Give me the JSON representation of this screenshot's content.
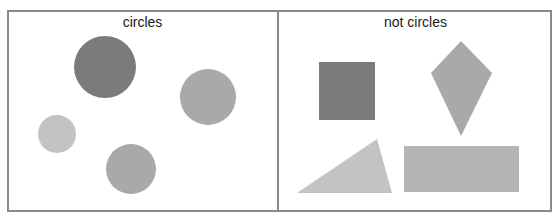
{
  "panels": [
    {
      "title": "circles",
      "shapes": [
        {
          "type": "circle",
          "cx": 105,
          "cy": 67,
          "r": 31,
          "color": "#7b7b7b"
        },
        {
          "type": "circle",
          "cx": 208,
          "cy": 97,
          "r": 28,
          "color": "#a9a9a9"
        },
        {
          "type": "circle",
          "cx": 57,
          "cy": 134,
          "r": 19,
          "color": "#c3c3c3"
        },
        {
          "type": "circle",
          "cx": 131,
          "cy": 169,
          "r": 25,
          "color": "#a9a9a9"
        }
      ]
    },
    {
      "title": "not circles",
      "shapes": [
        {
          "type": "square",
          "x": 319,
          "y": 62,
          "w": 56,
          "h": 58,
          "color": "#7b7b7b"
        },
        {
          "type": "kite",
          "points": "461,41 492,73 461,136 431,73",
          "color": "#a9a9a9"
        },
        {
          "type": "triangle",
          "points": "297,193 377,139 392,193",
          "color": "#c3c3c3"
        },
        {
          "type": "rectangle",
          "x": 404,
          "y": 146,
          "w": 115,
          "h": 46,
          "color": "#b5b5b5"
        }
      ]
    }
  ],
  "colors": {
    "frame": "#8a8a8a",
    "background": "#ffffff",
    "text": "#1a1a1a"
  }
}
